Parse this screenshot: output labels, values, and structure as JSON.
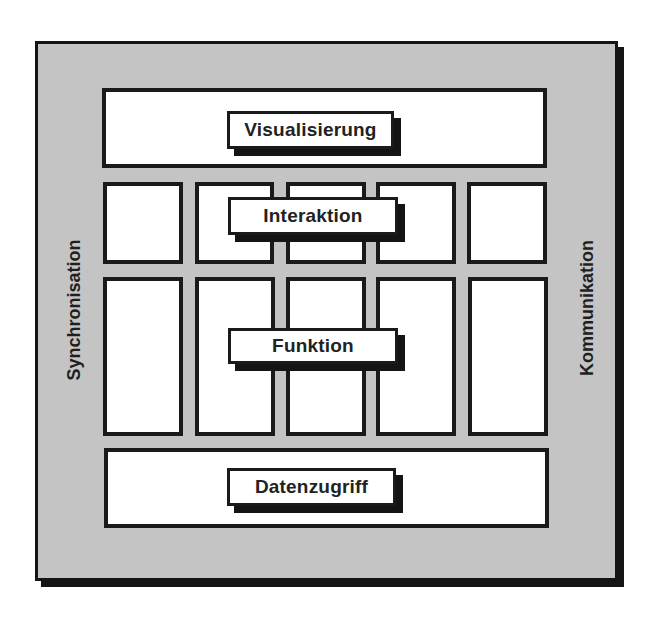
{
  "diagram": {
    "title": "",
    "colors": {
      "frame_fill": "#c4c4c4",
      "border": "#1a1a1a",
      "box_fill": "#ffffff",
      "text": "#222222"
    },
    "layers": [
      {
        "id": "visualisierung",
        "label": "Visualisierung"
      },
      {
        "id": "interaktion",
        "label": "Interaktion"
      },
      {
        "id": "funktion",
        "label": "Funktion"
      },
      {
        "id": "datenzugriff",
        "label": "Datenzugriff"
      }
    ],
    "side_labels": {
      "left": "Synchronisation",
      "right": "Kommunikation"
    },
    "columns": 5
  }
}
